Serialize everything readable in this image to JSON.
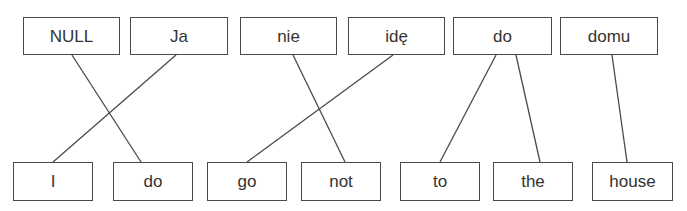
{
  "diagram": {
    "type": "word-alignment",
    "source_language": "Polish",
    "target_language": "English",
    "colors": {
      "line": "#4a4a4a",
      "box_border": "#4a4a4a",
      "text": "#333333",
      "background": "#ffffff"
    },
    "source_words": [
      {
        "id": "s0",
        "text": "NULL",
        "x": 23,
        "y": 17,
        "w": 97,
        "h": 38,
        "anchor_x": 72
      },
      {
        "id": "s1",
        "text": "Ja",
        "x": 130,
        "y": 17,
        "w": 98,
        "h": 38,
        "anchor_x": 176
      },
      {
        "id": "s2",
        "text": "nie",
        "x": 240,
        "y": 17,
        "w": 97,
        "h": 38,
        "anchor_x": 293
      },
      {
        "id": "s3",
        "text": "idę",
        "x": 348,
        "y": 17,
        "w": 97,
        "h": 38,
        "anchor_x": 393
      },
      {
        "id": "s4",
        "text": "do",
        "x": 453,
        "y": 17,
        "w": 99,
        "h": 38,
        "anchor_x": 506
      },
      {
        "id": "s5",
        "text": "domu",
        "x": 560,
        "y": 17,
        "w": 98,
        "h": 38,
        "anchor_x": 612
      }
    ],
    "target_words": [
      {
        "id": "t0",
        "text": "I",
        "x": 13,
        "y": 162,
        "w": 80,
        "h": 39,
        "anchor_x": 53
      },
      {
        "id": "t1",
        "text": "do",
        "x": 113,
        "y": 162,
        "w": 80,
        "h": 39,
        "anchor_x": 141
      },
      {
        "id": "t2",
        "text": "go",
        "x": 207,
        "y": 162,
        "w": 80,
        "h": 39,
        "anchor_x": 247
      },
      {
        "id": "t3",
        "text": "not",
        "x": 301,
        "y": 162,
        "w": 80,
        "h": 39,
        "anchor_x": 345
      },
      {
        "id": "t4",
        "text": "to",
        "x": 400,
        "y": 162,
        "w": 80,
        "h": 39,
        "anchor_x": 440
      },
      {
        "id": "t5",
        "text": "the",
        "x": 493,
        "y": 162,
        "w": 80,
        "h": 39,
        "anchor_x": 540
      },
      {
        "id": "t6",
        "text": "house",
        "x": 592,
        "y": 162,
        "w": 81,
        "h": 39,
        "anchor_x": 627
      }
    ],
    "alignments": [
      {
        "from": "NULL",
        "to": "do",
        "x1": 72,
        "y1": 55,
        "x2": 141,
        "y2": 162
      },
      {
        "from": "Ja",
        "to": "I",
        "x1": 176,
        "y1": 55,
        "x2": 53,
        "y2": 162
      },
      {
        "from": "nie",
        "to": "not",
        "x1": 293,
        "y1": 55,
        "x2": 345,
        "y2": 162
      },
      {
        "from": "idę",
        "to": "go",
        "x1": 393,
        "y1": 55,
        "x2": 247,
        "y2": 162
      },
      {
        "from": "do",
        "to": "to",
        "x1": 496,
        "y1": 55,
        "x2": 440,
        "y2": 162
      },
      {
        "from": "do",
        "to": "the",
        "x1": 516,
        "y1": 55,
        "x2": 540,
        "y2": 162
      },
      {
        "from": "domu",
        "to": "house",
        "x1": 612,
        "y1": 55,
        "x2": 627,
        "y2": 162
      }
    ]
  }
}
